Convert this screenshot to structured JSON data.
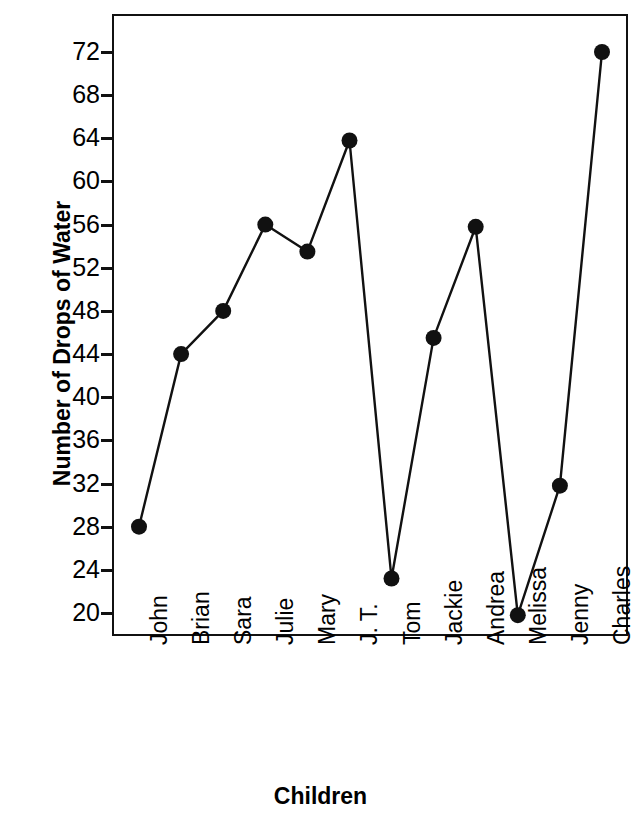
{
  "chart_data": {
    "type": "line",
    "title": "",
    "xlabel": "Children",
    "ylabel": "Number of Drops of Water",
    "categories": [
      "John",
      "Brian",
      "Sara",
      "Julie",
      "Mary",
      "J. T.",
      "Tom",
      "Jackie",
      "Andrea",
      "Melissa",
      "Jenny",
      "Charles"
    ],
    "values": [
      28,
      44,
      48,
      56,
      53.5,
      63.8,
      23.2,
      45.5,
      55.8,
      19.8,
      31.8,
      72
    ],
    "series": [
      {
        "name": "Number of Drops of Water",
        "values": [
          28,
          44,
          48,
          56,
          53.5,
          63.8,
          23.2,
          45.5,
          55.8,
          19.8,
          31.8,
          72
        ]
      }
    ],
    "ylim": [
      18,
      74
    ],
    "yticks": [
      72,
      68,
      64,
      60,
      56,
      52,
      48,
      44,
      40,
      36,
      32,
      28,
      24,
      20
    ],
    "ytick_labels": [
      "72",
      "68",
      "64",
      "60",
      "56",
      "52",
      "48",
      "44",
      "40",
      "36",
      "32",
      "28",
      "24",
      "20"
    ],
    "grid": false,
    "legend": "none",
    "marker": "filled-circle",
    "line_color": "#111111",
    "marker_color": "#111111",
    "background_color": "#ffffff"
  }
}
